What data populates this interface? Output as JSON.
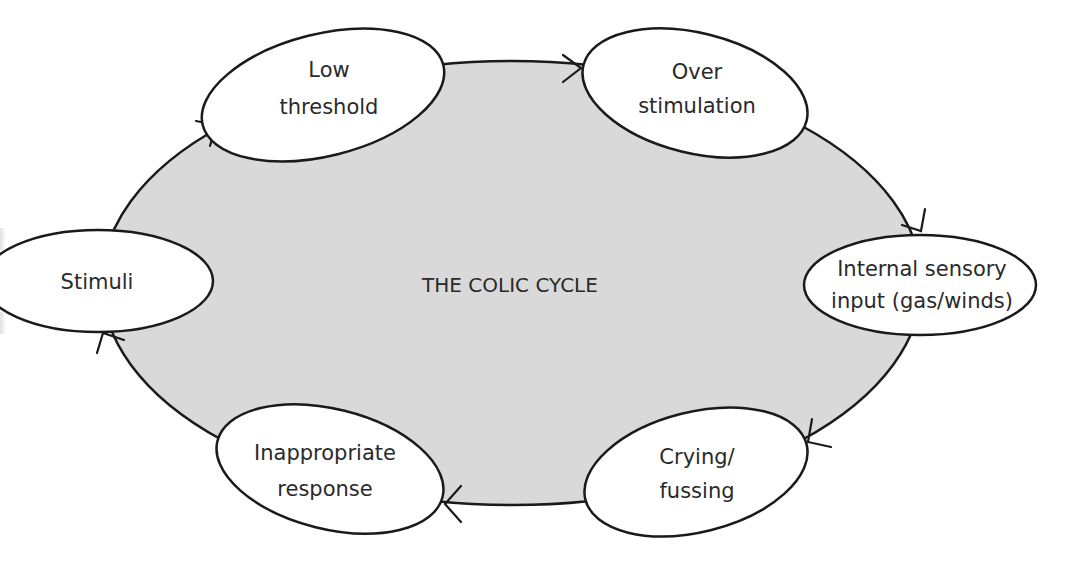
{
  "diagram": {
    "title": "THE COLIC CYCLE",
    "colors": {
      "background": "#ffffff",
      "cycle_fill": "#d9d9d9",
      "node_fill": "#ffffff",
      "stroke": "#1a1a1a",
      "text": "#2a2a2a"
    },
    "nodes": [
      {
        "id": "low-threshold",
        "lines": [
          "Low",
          "threshold"
        ]
      },
      {
        "id": "over-stimulation",
        "lines": [
          "Over",
          "stimulation"
        ]
      },
      {
        "id": "internal-sensory-input",
        "lines": [
          "Internal sensory",
          "input (gas/winds)"
        ]
      },
      {
        "id": "crying-fussing",
        "lines": [
          "Crying/",
          "fussing"
        ]
      },
      {
        "id": "inappropriate-response",
        "lines": [
          "Inappropriate",
          "response"
        ]
      },
      {
        "id": "stimuli",
        "lines": [
          "Stimuli"
        ]
      }
    ],
    "edges": [
      {
        "from": "stimuli",
        "to": "low-threshold"
      },
      {
        "from": "low-threshold",
        "to": "over-stimulation"
      },
      {
        "from": "over-stimulation",
        "to": "internal-sensory-input"
      },
      {
        "from": "internal-sensory-input",
        "to": "crying-fussing"
      },
      {
        "from": "crying-fussing",
        "to": "inappropriate-response"
      },
      {
        "from": "inappropriate-response",
        "to": "stimuli"
      }
    ]
  }
}
